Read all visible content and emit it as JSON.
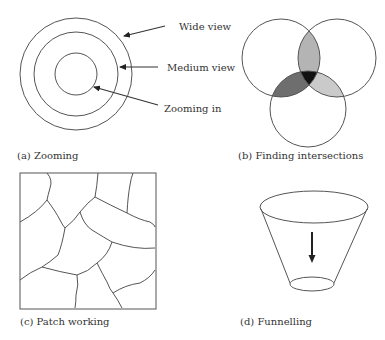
{
  "panels": {
    "a": {
      "caption": "(a) Zooming",
      "labels": {
        "wide": "Wide view",
        "medium": "Medium view",
        "zoom": "Zooming in"
      }
    },
    "b": {
      "caption": "(b) Finding intersections",
      "colors": {
        "top_lens": "#b4b4b4",
        "left_lens": "#6e6e6e",
        "right_lens": "#cacaca",
        "center": "#111111"
      }
    },
    "c": {
      "caption": "(c) Patch working"
    },
    "d": {
      "caption": "(d) Funnelling"
    }
  }
}
